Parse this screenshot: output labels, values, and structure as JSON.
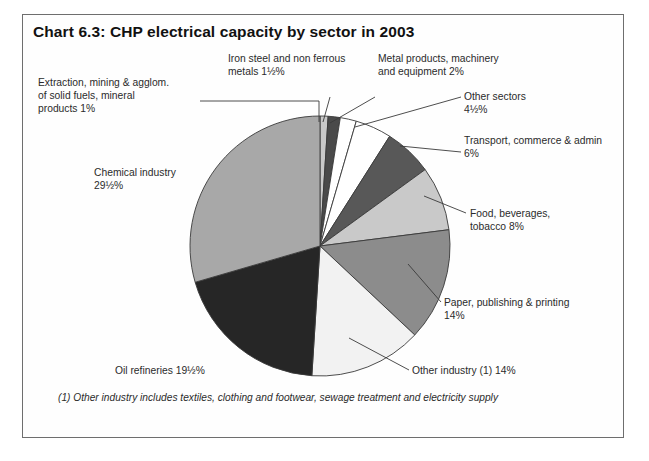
{
  "chart": {
    "title": "Chart 6.3:  CHP electrical capacity by sector in 2003",
    "footnote": "(1) Other industry includes textiles, clothing and footwear, sewage treatment and electricity supply"
  },
  "chart_data": {
    "type": "pie",
    "title": "Chart 6.3:  CHP electrical capacity by sector in 2003",
    "xlabel": "",
    "ylabel": "",
    "units": "percent of total CHP electrical capacity",
    "legend": "none (direct labels with leader lines)",
    "grid": false,
    "start_angle_deg": 0,
    "direction": "clockwise",
    "categories": [
      "Extraction, mining & agglom. of solid fuels, mineral products",
      "Iron steel and non ferrous metals",
      "Metal products, machinery and equipment",
      "Other sectors",
      "Transport, commerce & admin",
      "Food, beverages, tobacco",
      "Paper, publishing & printing",
      "Other industry (1)",
      "Oil refineries",
      "Chemical industry"
    ],
    "values": [
      1,
      1.5,
      2,
      4.5,
      6,
      8,
      14,
      14,
      19.5,
      29.5
    ],
    "value_labels": [
      "1%",
      "1½%",
      "2%",
      "4½%",
      "6%",
      "8%",
      "14%",
      "14%",
      "19½%",
      "29½%"
    ],
    "colors": [
      "#c9c9c9",
      "#4a4a4a",
      "#ffffff",
      "#ffffff",
      "#585858",
      "#c9c9c9",
      "#8c8c8c",
      "#f2f2f2",
      "#262626",
      "#a8a8a8"
    ],
    "total": 101.5
  },
  "labels": {
    "extraction": "Extraction, mining & agglom.\nof solid fuels, mineral\nproducts 1%",
    "chemical": "Chemical industry\n29½%",
    "oil": "Oil refineries 19½%",
    "ironsteel": "Iron steel and non ferrous\nmetals 1½%",
    "metalprod": "Metal products, machinery\nand equipment 2%",
    "othersectors": "Other sectors\n4½%",
    "transport": "Transport, commerce & admin\n6%",
    "food": "Food, beverages,\ntobacco 8%",
    "paper": "Paper, publishing & printing\n14%",
    "otherind": "Other industry (1) 14%"
  }
}
